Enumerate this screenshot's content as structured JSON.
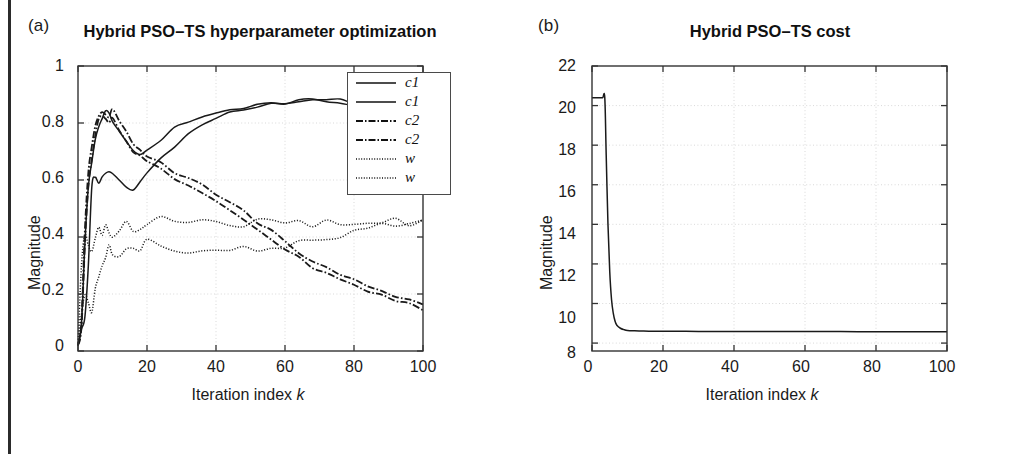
{
  "figure": {
    "background": "#ffffff",
    "border_color": "#2b2b2b"
  },
  "panels": [
    {
      "letter": "(a)",
      "title": "Hybrid PSO–TS hyperparameter optimization",
      "xlabel_text": "Iteration index",
      "xlabel_italic": "k",
      "ylabel": "Magnitude",
      "xticks": [
        "0",
        "20",
        "40",
        "60",
        "80",
        "100"
      ],
      "yticks": [
        "0",
        "0.2",
        "0.4",
        "0.6",
        "0.8",
        "1"
      ],
      "legend": [
        {
          "label": "c1",
          "style": "solid"
        },
        {
          "label": "c1",
          "style": "solid"
        },
        {
          "label": "c2",
          "style": "dashdot"
        },
        {
          "label": "c2",
          "style": "dashdot"
        },
        {
          "label": "w",
          "style": "dotted"
        },
        {
          "label": "w",
          "style": "dotted"
        }
      ]
    },
    {
      "letter": "(b)",
      "title": "Hybrid PSO–TS cost",
      "xlabel_text": "Iteration index",
      "xlabel_italic": "k",
      "ylabel": "Magnitude",
      "xticks": [
        "0",
        "20",
        "40",
        "60",
        "80",
        "100"
      ],
      "yticks": [
        "8",
        "10",
        "12",
        "14",
        "16",
        "18",
        "20",
        "22"
      ]
    }
  ],
  "chart_data": [
    {
      "type": "line",
      "title": "Hybrid PSO–TS hyperparameter optimization",
      "panel": "(a)",
      "xlabel": "Iteration index k",
      "ylabel": "Magnitude",
      "xlim": [
        0,
        100
      ],
      "ylim": [
        0,
        1
      ],
      "xticks": [
        0,
        20,
        40,
        60,
        80,
        100
      ],
      "yticks": [
        0,
        0.2,
        0.4,
        0.6,
        0.8,
        1
      ],
      "grid": true,
      "legend_position": "upper right",
      "series": [
        {
          "name": "c1",
          "style": "solid",
          "x": [
            0,
            1,
            2,
            3,
            4,
            5,
            6,
            7,
            8,
            9,
            10,
            12,
            14,
            16,
            18,
            20,
            24,
            28,
            32,
            36,
            40,
            44,
            48,
            52,
            56,
            60,
            64,
            68,
            72,
            76,
            80,
            84,
            88,
            92,
            96,
            100
          ],
          "y": [
            0.02,
            0.09,
            0.38,
            0.58,
            0.66,
            0.74,
            0.79,
            0.82,
            0.84,
            0.83,
            0.81,
            0.77,
            0.73,
            0.7,
            0.69,
            0.7,
            0.74,
            0.78,
            0.8,
            0.82,
            0.835,
            0.845,
            0.855,
            0.862,
            0.868,
            0.872,
            0.876,
            0.88,
            0.876,
            0.87,
            0.862,
            0.858,
            0.862,
            0.866,
            0.864,
            0.862
          ]
        },
        {
          "name": "c1",
          "style": "solid",
          "x": [
            0,
            1,
            2,
            3,
            4,
            5,
            6,
            7,
            8,
            9,
            10,
            12,
            14,
            16,
            18,
            20,
            24,
            28,
            32,
            36,
            40,
            44,
            48,
            52,
            56,
            60,
            64,
            68,
            72,
            76,
            80,
            84,
            88,
            92,
            96,
            100
          ],
          "y": [
            0.02,
            0.08,
            0.12,
            0.3,
            0.58,
            0.61,
            0.59,
            0.61,
            0.62,
            0.63,
            0.62,
            0.6,
            0.58,
            0.57,
            0.59,
            0.63,
            0.68,
            0.72,
            0.76,
            0.79,
            0.815,
            0.835,
            0.85,
            0.858,
            0.864,
            0.87,
            0.876,
            0.882,
            0.885,
            0.88,
            0.872,
            0.868,
            0.856,
            0.852,
            0.858,
            0.862
          ]
        },
        {
          "name": "c2",
          "style": "dashdot",
          "x": [
            0,
            1,
            2,
            3,
            4,
            5,
            6,
            7,
            8,
            9,
            10,
            12,
            14,
            16,
            18,
            20,
            24,
            28,
            32,
            36,
            40,
            44,
            48,
            52,
            56,
            60,
            64,
            68,
            72,
            76,
            80,
            84,
            88,
            92,
            96,
            100
          ],
          "y": [
            0.02,
            0.1,
            0.42,
            0.62,
            0.72,
            0.79,
            0.83,
            0.845,
            0.835,
            0.82,
            0.845,
            0.8,
            0.77,
            0.73,
            0.71,
            0.69,
            0.66,
            0.63,
            0.605,
            0.58,
            0.555,
            0.525,
            0.49,
            0.455,
            0.42,
            0.385,
            0.35,
            0.32,
            0.29,
            0.265,
            0.245,
            0.225,
            0.205,
            0.19,
            0.175,
            0.165
          ]
        },
        {
          "name": "c2",
          "style": "dashdot",
          "x": [
            0,
            1,
            2,
            3,
            4,
            5,
            6,
            7,
            8,
            9,
            10,
            12,
            14,
            16,
            18,
            20,
            24,
            28,
            32,
            36,
            40,
            44,
            48,
            52,
            56,
            60,
            64,
            68,
            72,
            76,
            80,
            84,
            88,
            92,
            96,
            100
          ],
          "y": [
            0.02,
            0.09,
            0.38,
            0.58,
            0.68,
            0.76,
            0.81,
            0.825,
            0.815,
            0.805,
            0.82,
            0.775,
            0.74,
            0.705,
            0.685,
            0.665,
            0.635,
            0.605,
            0.58,
            0.555,
            0.525,
            0.495,
            0.46,
            0.425,
            0.39,
            0.355,
            0.325,
            0.295,
            0.27,
            0.245,
            0.225,
            0.205,
            0.19,
            0.175,
            0.16,
            0.15
          ]
        },
        {
          "name": "w",
          "style": "dotted",
          "x": [
            0,
            1,
            2,
            3,
            4,
            5,
            6,
            7,
            8,
            9,
            10,
            12,
            14,
            16,
            18,
            20,
            24,
            28,
            32,
            36,
            40,
            44,
            48,
            52,
            56,
            60,
            64,
            68,
            72,
            76,
            80,
            84,
            88,
            92,
            96,
            100
          ],
          "y": [
            0.02,
            0.3,
            0.41,
            0.38,
            0.36,
            0.4,
            0.43,
            0.4,
            0.45,
            0.42,
            0.39,
            0.42,
            0.45,
            0.41,
            0.43,
            0.44,
            0.46,
            0.45,
            0.44,
            0.455,
            0.46,
            0.45,
            0.44,
            0.45,
            0.455,
            0.46,
            0.455,
            0.445,
            0.45,
            0.445,
            0.435,
            0.445,
            0.45,
            0.455,
            0.45,
            0.455
          ]
        },
        {
          "name": "w",
          "style": "dotted",
          "x": [
            0,
            1,
            2,
            3,
            4,
            5,
            6,
            7,
            8,
            9,
            10,
            12,
            14,
            16,
            18,
            20,
            24,
            28,
            32,
            36,
            40,
            44,
            48,
            52,
            56,
            60,
            64,
            68,
            72,
            76,
            80,
            84,
            88,
            92,
            96,
            100
          ],
          "y": [
            0.02,
            0.12,
            0.19,
            0.17,
            0.14,
            0.22,
            0.27,
            0.31,
            0.34,
            0.36,
            0.34,
            0.32,
            0.35,
            0.37,
            0.36,
            0.38,
            0.36,
            0.345,
            0.335,
            0.34,
            0.345,
            0.35,
            0.355,
            0.36,
            0.365,
            0.37,
            0.375,
            0.385,
            0.395,
            0.405,
            0.415,
            0.425,
            0.435,
            0.445,
            0.45,
            0.452
          ]
        }
      ]
    },
    {
      "type": "line",
      "title": "Hybrid PSO–TS cost",
      "panel": "(b)",
      "xlabel": "Iteration index k",
      "ylabel": "Magnitude",
      "xlim": [
        0,
        100
      ],
      "ylim": [
        7.6,
        22
      ],
      "xticks": [
        0,
        20,
        40,
        60,
        80,
        100
      ],
      "yticks": [
        8,
        10,
        12,
        14,
        16,
        18,
        20,
        22
      ],
      "grid": true,
      "series": [
        {
          "name": "cost",
          "style": "solid",
          "x": [
            0,
            1,
            2,
            3,
            3.6,
            4,
            4.5,
            5,
            5.5,
            6,
            6.5,
            7,
            8,
            9,
            10,
            12,
            14,
            16,
            20,
            30,
            40,
            50,
            60,
            70,
            80,
            90,
            100
          ],
          "y": [
            20.4,
            20.4,
            20.4,
            20.4,
            20.4,
            17.5,
            14.0,
            11.6,
            10.2,
            9.5,
            9.1,
            8.9,
            8.75,
            8.68,
            8.64,
            8.62,
            8.61,
            8.6,
            8.6,
            8.59,
            8.59,
            8.58,
            8.58,
            8.58,
            8.57,
            8.57,
            8.57
          ]
        }
      ]
    }
  ]
}
